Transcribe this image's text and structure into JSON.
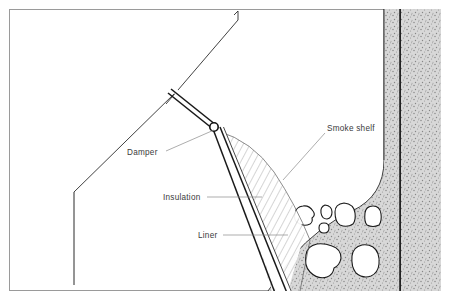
{
  "figure": {
    "kind": "technical-cutaway-diagram",
    "frame": {
      "border_color": "#9a9a9a",
      "background_color": "#ffffff"
    },
    "colors": {
      "outline": "#1a1a1a",
      "leader_line": "#8a8a8a",
      "label_text": "#3b3b3b",
      "masonry_fill": "#d2d2d2",
      "masonry_speckle": "#8e8e8e",
      "stone_fill": "#ffffff",
      "liner_fill": "#ffffff",
      "insulation_hatch": "#5a5a5a"
    },
    "labels": [
      {
        "id": "damper",
        "text": "Damper",
        "text_x": 127,
        "text_y": 155,
        "anchor": "start",
        "leader": [
          [
            166,
            151
          ],
          [
            214,
            130
          ]
        ],
        "target": "damper-pivot"
      },
      {
        "id": "insulation",
        "text": "Insulation",
        "text_x": 163,
        "text_y": 200,
        "anchor": "start",
        "leader": [
          [
            207,
            197
          ],
          [
            262,
            197
          ]
        ],
        "target": "insulation-layer"
      },
      {
        "id": "liner",
        "text": "Liner",
        "text_x": 198,
        "text_y": 238,
        "anchor": "start",
        "leader": [
          [
            223,
            235
          ],
          [
            288,
            235
          ]
        ],
        "target": "flue-liner"
      },
      {
        "id": "smoke-shelf",
        "text": "Smoke shelf",
        "text_x": 327,
        "text_y": 131,
        "anchor": "start",
        "leader": [
          [
            325,
            133
          ],
          [
            283,
            180
          ]
        ],
        "target": "smoke-shelf-curve"
      }
    ],
    "parts": [
      {
        "id": "roof-slope",
        "name": "Sloped firebox back wall"
      },
      {
        "id": "left-wall",
        "name": "Vertical firebox side wall"
      },
      {
        "id": "damper-blade",
        "name": "Damper blade"
      },
      {
        "id": "damper-pivot",
        "name": "Damper pivot hinge"
      },
      {
        "id": "flue-liner",
        "name": "Flue liner"
      },
      {
        "id": "insulation-layer",
        "name": "Insulation layer"
      },
      {
        "id": "smoke-shelf-curve",
        "name": "Smoke shelf"
      },
      {
        "id": "masonry-mass",
        "name": "Masonry chimney mass"
      },
      {
        "id": "flue-wall-right",
        "name": "Right flue wall"
      },
      {
        "id": "stones",
        "name": "Stone rubble infill"
      }
    ],
    "stones": [
      {
        "id": "stone-1",
        "d": "M303,206 q-7,1 -8,7 q-2,7 3,10 q6,4 12,1 q3,-2 2,-6 q4,-3 1,-7 q-4,-6 -10,-5 z"
      },
      {
        "id": "stone-2",
        "d": "M325,205 q-5,2 -4,8 q1,6 6,6 q5,-1 5,-7 q0,-6 -7,-7 z"
      },
      {
        "id": "stone-3",
        "d": "M324,223 q-5,0 -5,5 q0,5 5,5 q5,0 5,-5 q0,-5 -5,-5 z"
      },
      {
        "id": "stone-4",
        "d": "M344,203 q-9,1 -9,9 q0,10 5,13 q7,3 13,-1 q3,-4 2,-11 q-1,-9 -11,-10 z"
      },
      {
        "id": "stone-5",
        "d": "M373,206 q-7,0 -8,7 q-1,9 2,12 q6,3 12,0 q3,-4 2,-11 q-1,-8 -8,-8 z"
      },
      {
        "id": "stone-6",
        "d": "M317,244 q-10,2 -11,11 q-2,11 4,17 q8,8 17,5 q6,-2 7,-9 q6,-3 7,-10 q0,-9 -9,-12 q-8,-3 -15,-2 z"
      },
      {
        "id": "stone-7",
        "d": "M362,245 q-9,2 -10,11 q-1,11 4,17 q7,6 15,3 q7,-3 8,-12 q1,-12 -6,-17 q-5,-3 -11,-2 z"
      }
    ]
  }
}
